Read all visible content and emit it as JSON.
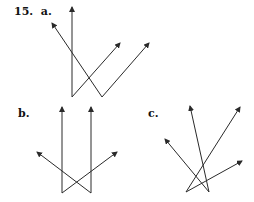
{
  "problem": {
    "number": "15.",
    "parts": [
      {
        "label": "a.",
        "vertices": [
          [
            72,
            97
          ],
          [
            102,
            97
          ]
        ],
        "rays": [
          {
            "from": [
              72,
              97
            ],
            "to": [
              72,
              7
            ]
          },
          {
            "from": [
              72,
              97
            ],
            "to": [
              120,
              43
            ]
          },
          {
            "from": [
              102,
              97
            ],
            "to": [
              52,
              23
            ]
          },
          {
            "from": [
              102,
              97
            ],
            "to": [
              149,
              43
            ]
          }
        ]
      },
      {
        "label": "b.",
        "vertices": [
          [
            62,
            193
          ],
          [
            91,
            193
          ]
        ],
        "rays": [
          {
            "from": [
              62,
              193
            ],
            "to": [
              62,
              107
            ]
          },
          {
            "from": [
              91,
              193
            ],
            "to": [
              91,
              107
            ]
          },
          {
            "from": [
              62,
              193
            ],
            "to": [
              117,
              152
            ]
          },
          {
            "from": [
              91,
              193
            ],
            "to": [
              37,
              152
            ]
          }
        ]
      },
      {
        "label": "c.",
        "vertices": [
          [
            186,
            192
          ],
          [
            209,
            192
          ]
        ],
        "rays": [
          {
            "from": [
              209,
              192
            ],
            "to": [
              190,
              106
            ]
          },
          {
            "from": [
              209,
              192
            ],
            "to": [
              165,
              139
            ]
          },
          {
            "from": [
              186,
              192
            ],
            "to": [
              240,
              107
            ]
          },
          {
            "from": [
              186,
              192
            ],
            "to": [
              242,
              161
            ]
          }
        ]
      }
    ]
  },
  "colors": {
    "line": "#2a2a2a",
    "text": "#111111"
  }
}
